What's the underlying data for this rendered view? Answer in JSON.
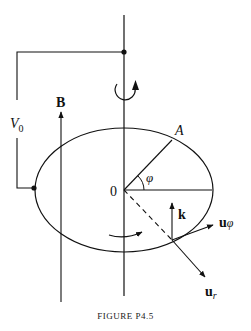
{
  "figure": {
    "caption": "FIGURE P4.5",
    "labels": {
      "voltage": "V",
      "voltage_sub": "0",
      "field": "B",
      "point_a": "A",
      "origin": "0",
      "angle": "φ",
      "k_vector": "k",
      "u_phi": "u",
      "u_phi_sub": "φ",
      "u_r": "u",
      "u_r_sub": "r"
    },
    "elements": [
      "vertical rotation axis",
      "circuit wire with voltage source V0",
      "magnetic field arrow B",
      "rotation-sense arrow about axis",
      "disk (ellipse in perspective) with center 0",
      "radius to point A at angle φ",
      "unit vectors k, u_φ, u_r at rim point",
      "rotation-sense arrow on disk"
    ],
    "colors": {
      "ink": "#111111",
      "background": "#ffffff"
    }
  }
}
